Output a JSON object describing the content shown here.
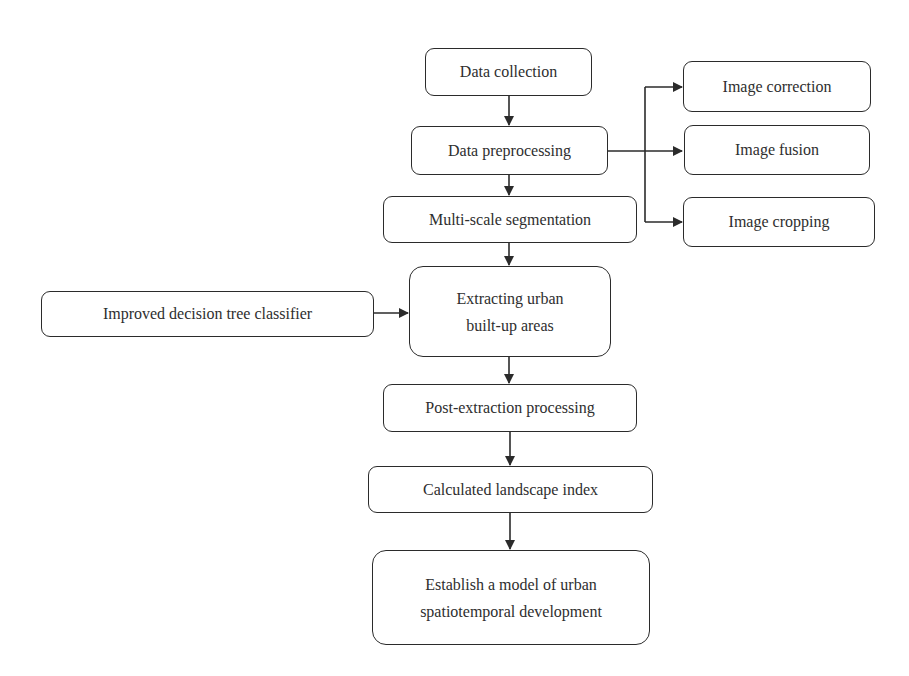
{
  "diagram": {
    "type": "flowchart",
    "colors": {
      "background": "#ffffff",
      "stroke": "#2b2b2b",
      "text": "#2e2e2e"
    },
    "nodes": {
      "data_collection": {
        "label": "Data collection"
      },
      "data_preprocessing": {
        "label": "Data preprocessing"
      },
      "multi_scale_segmentation": {
        "label": "Multi-scale segmentation"
      },
      "extracting_urban": {
        "label": "Extracting urban\nbuilt-up areas"
      },
      "improved_classifier": {
        "label": "Improved decision tree classifier"
      },
      "post_extraction": {
        "label": "Post-extraction processing"
      },
      "landscape_index": {
        "label": "Calculated landscape index"
      },
      "establish_model": {
        "label": "Establish a model of urban\nspatiotemporal development"
      },
      "image_correction": {
        "label": "Image correction"
      },
      "image_fusion": {
        "label": "Image fusion"
      },
      "image_cropping": {
        "label": "Image cropping"
      }
    },
    "edges": [
      {
        "from": "data_collection",
        "to": "data_preprocessing"
      },
      {
        "from": "data_preprocessing",
        "to": "multi_scale_segmentation"
      },
      {
        "from": "data_preprocessing",
        "to": "image_correction"
      },
      {
        "from": "data_preprocessing",
        "to": "image_fusion"
      },
      {
        "from": "data_preprocessing",
        "to": "image_cropping"
      },
      {
        "from": "multi_scale_segmentation",
        "to": "extracting_urban"
      },
      {
        "from": "improved_classifier",
        "to": "extracting_urban"
      },
      {
        "from": "extracting_urban",
        "to": "post_extraction"
      },
      {
        "from": "post_extraction",
        "to": "landscape_index"
      },
      {
        "from": "landscape_index",
        "to": "establish_model"
      }
    ]
  }
}
